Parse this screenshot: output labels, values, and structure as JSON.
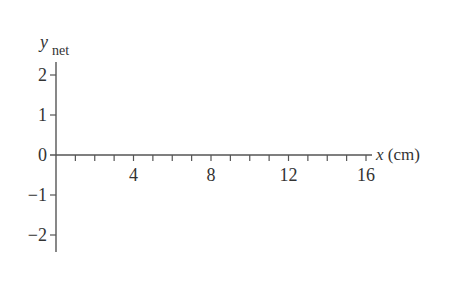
{
  "chart_data": {
    "type": "line",
    "title": "",
    "xlabel": "x (cm)",
    "xlabel_var": "x",
    "xlabel_unit": "(cm)",
    "ylabel": "y_net",
    "ylabel_main": "y",
    "ylabel_sub": "net",
    "xlim": [
      0,
      16
    ],
    "ylim": [
      -2,
      2
    ],
    "x_major_ticks": [
      4,
      8,
      12,
      16
    ],
    "x_minor_tick_step": 1,
    "y_ticks": [
      2,
      1,
      0,
      -1,
      -2
    ],
    "y_tick_labels": [
      "2",
      "1",
      "0",
      "−1",
      "−2"
    ],
    "x_tick_labels": [
      "4",
      "8",
      "12",
      "16"
    ],
    "grid": false,
    "legend": null,
    "series": []
  },
  "colors": {
    "axis": "#555555",
    "text": "#333333",
    "background": "#ffffff"
  }
}
